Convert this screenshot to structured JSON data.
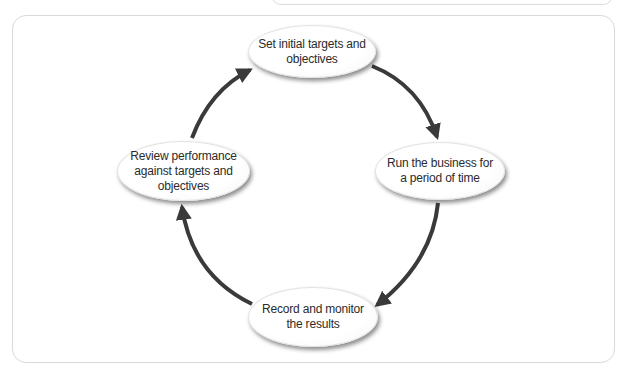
{
  "top_fragment": {
    "text": "..."
  },
  "diagram": {
    "type": "cycle",
    "arrow_color": "#3a3a3a",
    "nodes": [
      {
        "id": "set",
        "label": "Set initial targets and\nobjectives"
      },
      {
        "id": "run",
        "label": "Run the business for\na period of time"
      },
      {
        "id": "record",
        "label": "Record and monitor\nthe results"
      },
      {
        "id": "review",
        "label": "Review performance\nagainst targets and\nobjectives"
      }
    ],
    "edges": [
      {
        "from": "set",
        "to": "run"
      },
      {
        "from": "run",
        "to": "record"
      },
      {
        "from": "record",
        "to": "review"
      },
      {
        "from": "review",
        "to": "set"
      }
    ]
  }
}
